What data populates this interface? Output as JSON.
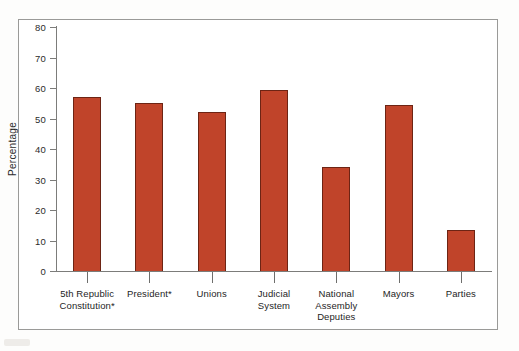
{
  "chart_data": {
    "type": "bar",
    "title": "",
    "xlabel": "",
    "ylabel": "Percentage",
    "ylim": [
      0,
      80
    ],
    "yticks": [
      0,
      10,
      20,
      30,
      40,
      50,
      60,
      70,
      80
    ],
    "grid": false,
    "legend": "none",
    "bar_color": "#C0442A",
    "bar_edge_color": "#6D2414",
    "categories": [
      "5th Republic Constitution*",
      "President*",
      "Unions",
      "Judicial System",
      "National Assembly Deputies",
      "Mayors",
      "Parties"
    ],
    "category_lines": [
      [
        "5th Republic",
        "Constitution*"
      ],
      [
        "President*"
      ],
      [
        "Unions"
      ],
      [
        "Judicial",
        "System"
      ],
      [
        "National",
        "Assembly",
        "Deputies"
      ],
      [
        "Mayors"
      ],
      [
        "Parties"
      ]
    ],
    "values": [
      57,
      55,
      52,
      59.5,
      34,
      54.5,
      13.5
    ]
  },
  "axis": {
    "y_title": "Percentage",
    "y_tick_labels": [
      "80",
      "70",
      "60",
      "50",
      "40",
      "30",
      "20",
      "10",
      "0"
    ]
  }
}
